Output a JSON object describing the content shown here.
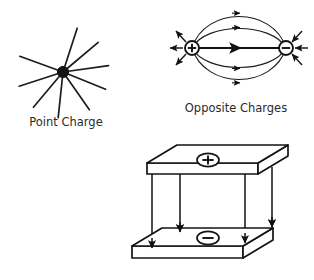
{
  "figure": {
    "background_color": "#ffffff",
    "ink_color": "#1c1c1c",
    "width": 314,
    "height": 280
  },
  "top_cropped_text": "",
  "panels": [
    {
      "id": "point-charge",
      "caption": "Point Charge",
      "caption_x": 66,
      "caption_y": 126,
      "type": "radial-field",
      "center": {
        "x": 63,
        "y": 72
      },
      "core_radius": 5.6,
      "ray_count": 9,
      "ray_angles_deg": [
        -72,
        -40,
        -8,
        22,
        55,
        96,
        130,
        162,
        200
      ],
      "ray_length": 46
    },
    {
      "id": "opposite-charges",
      "caption": "Opposite Charges",
      "caption_x": 236,
      "caption_y": 112,
      "type": "dipole-field",
      "positive_charge": {
        "label": "+",
        "x": 192,
        "y": 48,
        "radius": 7
      },
      "negative_charge": {
        "label": "−",
        "x": 286,
        "y": 48,
        "radius": 7
      },
      "field_line_count": 5,
      "arrow_direction": "positive-to-negative",
      "spoke_count_per_charge": 3
    },
    {
      "id": "parallel-plates",
      "caption": "",
      "type": "parallel-plate-capacitor",
      "top_plate": {
        "sign": "+",
        "sign_x": 208,
        "sign_y": 163
      },
      "bottom_plate": {
        "sign": "−",
        "sign_x": 208,
        "sign_y": 239
      },
      "field_arrow_count": 4,
      "field_direction": "downward"
    }
  ]
}
